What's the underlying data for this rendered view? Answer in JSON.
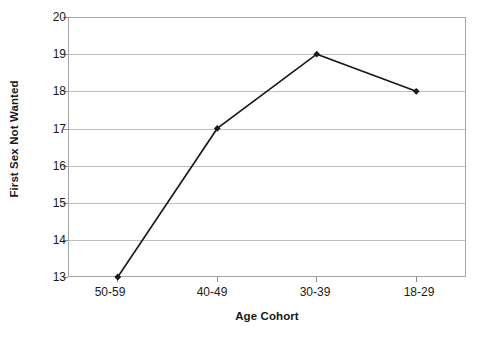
{
  "chart_data": {
    "type": "line",
    "title": "",
    "xlabel": "Age Cohort",
    "ylabel": "First Sex Not Wanted",
    "categories": [
      "50-59",
      "40-49",
      "30-39",
      "18-29"
    ],
    "values": [
      13,
      17,
      19,
      18
    ],
    "series": [
      {
        "name": "First Sex Not Wanted",
        "values": [
          13,
          17,
          19,
          18
        ]
      }
    ],
    "ylim": [
      13,
      20
    ],
    "ytick_labels": [
      "20",
      "19",
      "18",
      "17",
      "16",
      "15",
      "14",
      "13"
    ],
    "ytick_values": [
      20,
      19,
      18,
      17,
      16,
      15,
      14,
      13
    ],
    "grid": "horizontal",
    "legend": "none",
    "marker": "diamond",
    "line_color": "#1a1a1a",
    "marker_color": "#1a1a1a",
    "gridline_color": "#bfbfbf",
    "plot_border_color": "#a6a6a6",
    "background_color": "#ffffff"
  }
}
